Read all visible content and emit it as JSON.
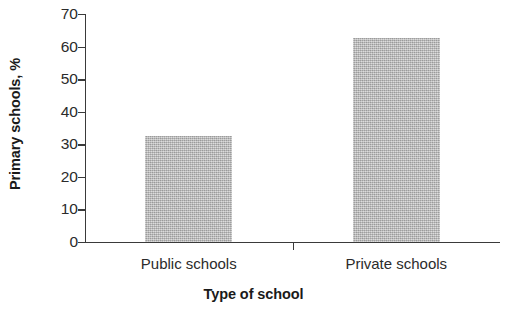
{
  "chart_data": {
    "type": "bar",
    "title": "",
    "xlabel": "Type of school",
    "ylabel": "Primary schools, %",
    "categories": [
      "Public schools",
      "Private schools"
    ],
    "values": [
      32.5,
      62.5
    ],
    "ylim": [
      0,
      70
    ],
    "ytick_labels": [
      "0",
      "10",
      "20",
      "30",
      "40",
      "50",
      "60",
      "70"
    ],
    "ytick_values": [
      0,
      10,
      20,
      30,
      40,
      50,
      60,
      70
    ],
    "grid": false,
    "legend": null,
    "bar_color": "#b6b6b6",
    "axis_color": "#3a3a3a",
    "text_color": "#2b2b2b"
  }
}
